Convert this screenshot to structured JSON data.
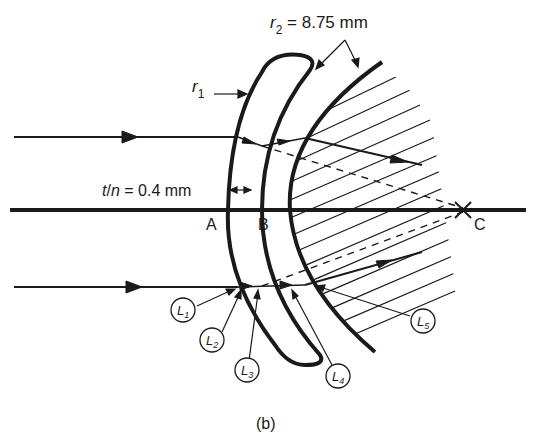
{
  "diagram": {
    "caption": "(b)",
    "labels": {
      "r2_symbol": "r",
      "r2_sub": "2",
      "r2_value": " = 8.75 mm",
      "r1_symbol": "r",
      "r1_sub": "1",
      "thickness_t": "t",
      "thickness_slash": "/",
      "thickness_n": "n",
      "thickness_value": " = 0.4 mm",
      "point_a": "A",
      "point_b": "B",
      "point_c": "C"
    },
    "callouts": [
      {
        "letter": "L",
        "sub": "1"
      },
      {
        "letter": "L",
        "sub": "2"
      },
      {
        "letter": "L",
        "sub": "3"
      },
      {
        "letter": "L",
        "sub": "4"
      },
      {
        "letter": "L",
        "sub": "5"
      }
    ],
    "colors": {
      "ink": "#1a1a1a",
      "background": "#ffffff"
    }
  }
}
